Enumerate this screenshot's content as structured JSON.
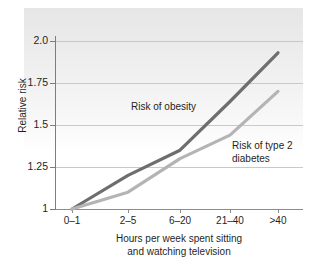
{
  "chart_data": {
    "type": "line",
    "title": "",
    "xlabel": "Hours per week spent sitting and watching television",
    "xlabel_line1": "Hours per week spent sitting",
    "xlabel_line2": "and watching television",
    "ylabel": "Relative risk",
    "categories": [
      "0–1",
      "2–5",
      "6–20",
      "21–40",
      ">40"
    ],
    "ylim": [
      1,
      2.0
    ],
    "yticks": [
      1,
      1.25,
      1.5,
      1.75,
      2.0
    ],
    "ytick_labels": [
      "1",
      "1.25",
      "1.5",
      "1.75",
      "2.0"
    ],
    "grid": "horizontal",
    "legend_position": "inline-annotations",
    "series": [
      {
        "name": "Risk of obesity",
        "label_line1": "Risk of obesity",
        "label_line2": "",
        "color": "#6e6e70",
        "values": [
          1.0,
          1.2,
          1.35,
          1.64,
          1.93
        ]
      },
      {
        "name": "Risk of type 2 diabetes",
        "label_line1": "Risk of type 2",
        "label_line2": "diabetes",
        "color": "#b4b4b6",
        "values": [
          1.0,
          1.1,
          1.3,
          1.44,
          1.7
        ]
      }
    ],
    "colors": {
      "obesity_line": "#6e6e70",
      "diabetes_line": "#b4b4b6",
      "gridline": "#c9c9c9",
      "axis": "#7d7d7d",
      "text": "#1f1f1f",
      "plot_wash_top": "#e6e6e6",
      "background": "#ffffff"
    }
  }
}
